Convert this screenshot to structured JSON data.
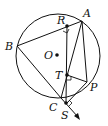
{
  "diagram": {
    "type": "geometry-simson-line",
    "circle": {
      "center": "O"
    },
    "points": [
      {
        "id": "A",
        "label": "A"
      },
      {
        "id": "B",
        "label": "B"
      },
      {
        "id": "C",
        "label": "C"
      },
      {
        "id": "P",
        "label": "P"
      },
      {
        "id": "O",
        "label": "O"
      },
      {
        "id": "R",
        "label": "R"
      },
      {
        "id": "T",
        "label": "T"
      },
      {
        "id": "S",
        "label": "S"
      }
    ],
    "segments": [
      "AB",
      "BC",
      "AC",
      "AP",
      "PR",
      "PT",
      "PS",
      "RS"
    ],
    "right_angles": [
      "R",
      "T",
      "S"
    ],
    "arrow": "BC extended past S"
  }
}
